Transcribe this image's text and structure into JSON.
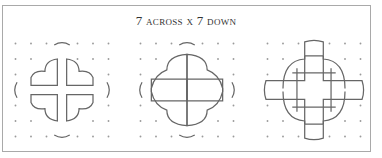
{
  "title": "7 across x 7 down",
  "grid": {
    "columns": 7,
    "rows": 7
  },
  "panels": [
    {
      "id": "panel-1",
      "label": "four separated petal quarters"
    },
    {
      "id": "panel-2",
      "label": "overlapping petal quarters"
    },
    {
      "id": "panel-3",
      "label": "rounded cross with tabs"
    }
  ],
  "colors": {
    "frame": "#a9a9a9",
    "line": "#666666",
    "dot": "#9a9a9a",
    "text": "#333333"
  }
}
